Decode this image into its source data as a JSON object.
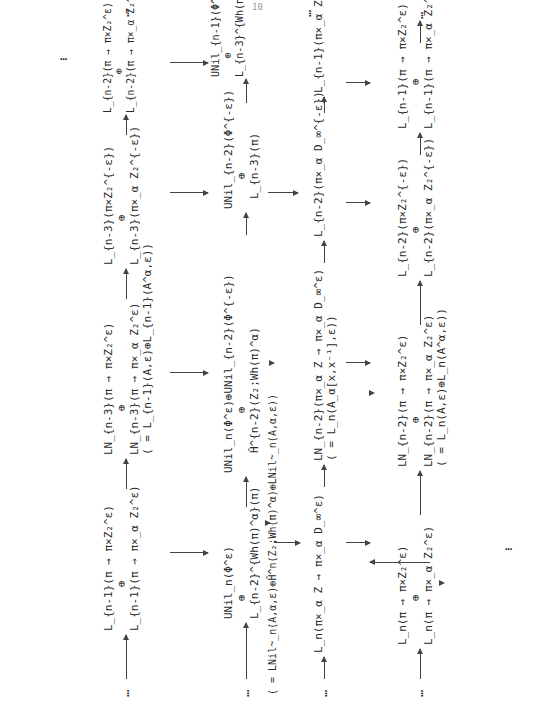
{
  "page": {
    "page_number": "10",
    "orientation": "rotated-90-ccw"
  },
  "rows": [
    {
      "id": "row1",
      "nodes": [
        {
          "lines": [
            "L_n(π → π×Z₂^ε)",
            "⊕",
            "L_n(π → π×_α Z₂^ε)"
          ]
        },
        {
          "lines": [
            "LN_{n-2}(π → π×Z₂^ε)",
            "⊕",
            "LN_{n-2}(π → π×_α Z₂^ε)",
            "( = L_n(A,ε)⊕L_n(A^α,ε))"
          ]
        },
        {
          "lines": [
            "L_{n-2}(π×Z₂^{-ε})",
            "⊕",
            "L_{n-2}(π×_α Z₂^{-ε})"
          ]
        },
        {
          "lines": [
            "L_{n-1}(π → π×Z₂^ε)",
            "⊕",
            "L_{n-1}(π → π×_α Z₂^ε)"
          ]
        }
      ]
    },
    {
      "id": "row2",
      "nodes": [
        {
          "lines": [
            "L_n(π×_α Z → π×_α D_∞^ε)"
          ]
        },
        {
          "lines": [
            "LN_{n-2}(π×_α Z → π×_α D_∞^ε)",
            "( = L_n(A_α[x,x⁻¹],ε))"
          ]
        },
        {
          "lines": [
            "L_{n-2}(π×_α D_∞^{-ε})"
          ]
        },
        {
          "lines": [
            "L_{n-1}(π×_α Z → π×_α D_∞^ε)"
          ]
        }
      ]
    },
    {
      "id": "row3",
      "nodes": [
        {
          "lines": [
            "UNil_n(Φ^ε)",
            "⊕",
            "L_{n-2}^{Wh(π)^α}(π)",
            "( = LNil~_n(A,α,ε)⊕Ĥ^n(Z₂;Wh(π)^α)⊕LNil~_n(A,α,ε))"
          ]
        },
        {
          "lines": [
            "UNil_n(Φ^ε)⊕UNil_{n-2}(Φ^{-ε})",
            "⊕",
            "Ĥ^{n-2}(Z₂;Wh(π)^α)"
          ]
        },
        {
          "lines": [
            "UNil_{n-2}(Φ^{-ε})",
            "⊕",
            "L_{n-3}(π)"
          ]
        },
        {
          "lines": [
            "UNil_{n-1}(Φ^ε)",
            "⊕",
            "L_{n-3}^{Wh(π)^α}(π)"
          ]
        }
      ]
    },
    {
      "id": "row4",
      "nodes": [
        {
          "lines": [
            "L_{n-1}(π → π×Z₂^ε)",
            "⊕",
            "L_{n-1}(π → π×_α Z₂^ε)"
          ]
        },
        {
          "lines": [
            "LN_{n-3}(π → π×Z₂^ε)",
            "⊕",
            "LN_{n-3}(π → π×_α Z₂^ε)",
            "( = L_{n-1}(A,ε)⊕L_{n-1}(A^α,ε))"
          ]
        },
        {
          "lines": [
            "L_{n-3}(π×Z₂^{-ε})",
            "⊕",
            "L_{n-3}(π×_α Z₂^{-ε})"
          ]
        },
        {
          "lines": [
            "L_{n-2}(π → π×Z₂^ε)",
            "⊕",
            "L_{n-2}(π → π×_α Z₂^ε)"
          ]
        }
      ]
    }
  ],
  "ellipsis": "…",
  "symbols": {
    "plus": "⊕",
    "arrow": "→"
  }
}
